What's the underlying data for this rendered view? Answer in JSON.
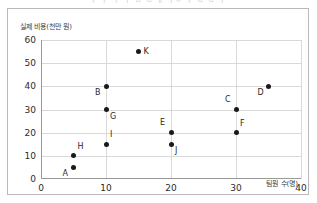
{
  "top_clip_text": "ㅣ ㅣ  ㅣ     ㅣ  ㅂ ㅂ ㅐ  ㅣㅇ ㅣ ㅂ ㅂ ㅣ",
  "chart_data": {
    "type": "scatter",
    "title": "",
    "xlabel": "팀원 수(명)",
    "ylabel": "실제 비용(천만 원)",
    "xlim": [
      0,
      40
    ],
    "ylim": [
      0,
      60
    ],
    "xticks": [
      0,
      10,
      20,
      30,
      40
    ],
    "yticks": [
      0,
      10,
      20,
      30,
      40,
      50,
      60
    ],
    "grid": true,
    "legend": "none",
    "marker_color": "#1a1a1a",
    "grid_color": "#d9d9d9",
    "axis_color": "#9a9a9a",
    "points": [
      {
        "label": "A",
        "x": 5,
        "y": 5,
        "label_pos": "left-below"
      },
      {
        "label": "B",
        "x": 10,
        "y": 40,
        "label_pos": "left-below"
      },
      {
        "label": "C",
        "x": 30,
        "y": 30,
        "label_pos": "left-above"
      },
      {
        "label": "D",
        "x": 35,
        "y": 40,
        "label_pos": "left-below"
      },
      {
        "label": "E",
        "x": 20,
        "y": 20,
        "label_pos": "left-above"
      },
      {
        "label": "F",
        "x": 30,
        "y": 20,
        "label_pos": "right-above"
      },
      {
        "label": "G",
        "x": 10,
        "y": 30,
        "label_pos": "right-below"
      },
      {
        "label": "H",
        "x": 5,
        "y": 10,
        "label_pos": "right-above"
      },
      {
        "label": "I",
        "x": 10,
        "y": 15,
        "label_pos": "right-above"
      },
      {
        "label": "J",
        "x": 20,
        "y": 15,
        "label_pos": "right-below"
      },
      {
        "label": "K",
        "x": 15,
        "y": 55,
        "label_pos": "right-mid"
      }
    ]
  }
}
